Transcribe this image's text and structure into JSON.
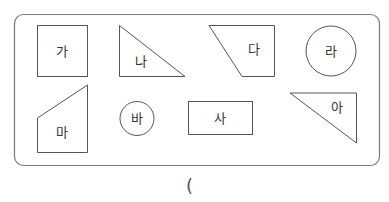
{
  "diagram": {
    "title": "",
    "frame": {
      "x": 14,
      "y": 14,
      "width": 365,
      "height": 151,
      "radius": 9,
      "stroke": "#777777"
    },
    "shapes": [
      {
        "id": "ga",
        "label": "가",
        "type": "square"
      },
      {
        "id": "na",
        "label": "나",
        "type": "right-triangle"
      },
      {
        "id": "da",
        "label": "다",
        "type": "trapezoid"
      },
      {
        "id": "ra",
        "label": "라",
        "type": "circle"
      },
      {
        "id": "ma",
        "label": "마",
        "type": "pentagon"
      },
      {
        "id": "ba",
        "label": "바",
        "type": "circle"
      },
      {
        "id": "sa",
        "label": "사",
        "type": "rectangle"
      },
      {
        "id": "a",
        "label": "아",
        "type": "right-triangle"
      }
    ],
    "answer_blank": {
      "open_paren": "("
    }
  },
  "colors": {
    "stroke": "#555555",
    "text": "#333333",
    "background": "#ffffff"
  }
}
